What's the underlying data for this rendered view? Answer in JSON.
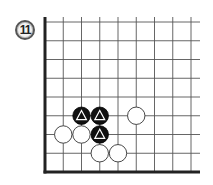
{
  "problem": {
    "number": "11"
  },
  "board": {
    "origin_x": 45,
    "origin_y": 172,
    "spacing_x": 18.25,
    "spacing_y": 18.75,
    "cols": 9,
    "rows": 9,
    "top_y": 17,
    "right_x": 200,
    "edges": [
      "left",
      "bottom"
    ],
    "line_color": "#555555",
    "edge_color": "#222222"
  },
  "stones": [
    {
      "color": "black",
      "col": 2,
      "row": 3,
      "marker": "triangle"
    },
    {
      "color": "black",
      "col": 3,
      "row": 3,
      "marker": "triangle"
    },
    {
      "color": "black",
      "col": 3,
      "row": 2,
      "marker": "triangle"
    },
    {
      "color": "white",
      "col": 5,
      "row": 3,
      "marker": ""
    },
    {
      "color": "white",
      "col": 1,
      "row": 2,
      "marker": ""
    },
    {
      "color": "white",
      "col": 2,
      "row": 2,
      "marker": ""
    },
    {
      "color": "white",
      "col": 3,
      "row": 1,
      "marker": ""
    },
    {
      "color": "white",
      "col": 4,
      "row": 1,
      "marker": ""
    }
  ]
}
